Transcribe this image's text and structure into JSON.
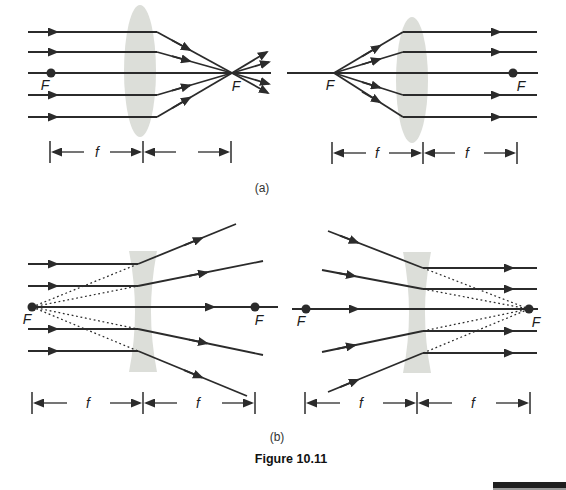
{
  "figure_caption": "Figure 10.11",
  "panel_labels": {
    "a": "(a)",
    "b": "(b)"
  },
  "colors": {
    "ink": "#2b2b2b",
    "lens": "#dcded9",
    "caption_text": "#333333",
    "figure_caption_text": "#111111",
    "footer_bar": "#1f1f1f",
    "background": "#ffffff"
  },
  "panels": {
    "a_left": {
      "left_focus": "F",
      "right_focus": "F",
      "seg1": "f"
    },
    "a_right": {
      "left_focus": "F",
      "right_focus": "F",
      "seg1": "f",
      "seg2": "f"
    },
    "b_left": {
      "left_focus": "F",
      "right_focus": "F",
      "seg1": "f",
      "seg2": "f"
    },
    "b_right": {
      "left_focus": "F",
      "right_focus": "F",
      "seg1": "f",
      "seg2": "f"
    }
  }
}
